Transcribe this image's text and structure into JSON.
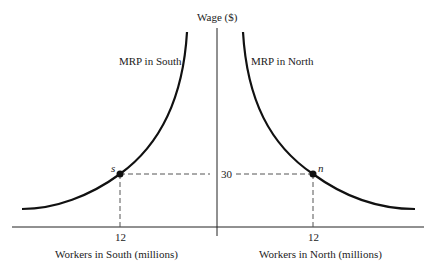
{
  "diagram": {
    "y_axis_label": "Wage ($)",
    "curves": [
      {
        "id": "south",
        "label": "MRP in South"
      },
      {
        "id": "north",
        "label": "MRP in North"
      }
    ],
    "points": [
      {
        "id": "s",
        "label": "s",
        "workers_millions": 12,
        "wage": 30
      },
      {
        "id": "n",
        "label": "n",
        "workers_millions": 12,
        "wage": 30
      }
    ],
    "wage_tick": "30",
    "x_ticks": {
      "south": "12",
      "north": "12"
    },
    "x_axis_labels": {
      "south": "Workers in South (millions)",
      "north": "Workers in North (millions)"
    },
    "colors": {
      "curve": "#111111",
      "axis": "#222222",
      "dashed": "#555555"
    }
  }
}
